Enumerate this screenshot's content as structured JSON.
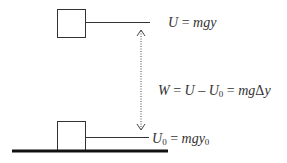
{
  "figure": {
    "width": 287,
    "height": 163,
    "colors": {
      "stroke": "#333333",
      "ground": "#111111",
      "text": "#333333",
      "background": "#ffffff"
    }
  },
  "top_block": {
    "x": 57,
    "y": 9,
    "size": 28,
    "reference_line": {
      "x1": 85,
      "x2": 150,
      "y": 22
    },
    "label": {
      "symbol": "U",
      "equals": " = ",
      "expr": "mgy"
    }
  },
  "bottom_block": {
    "x": 57,
    "y": 121,
    "size": 29,
    "reference_line": {
      "x1": 85,
      "x2": 149,
      "y": 137
    },
    "label": {
      "symbol": "U",
      "sub": "0",
      "equals": " = ",
      "expr": "mgy",
      "expr_sub": "0"
    }
  },
  "ground": {
    "x1": 12,
    "x2": 168,
    "y": 151,
    "thickness": 3
  },
  "displacement_arrow": {
    "x": 141,
    "y1": 30,
    "y2": 130,
    "style": "dotted",
    "heads": "both"
  },
  "work_equation": {
    "W": "W",
    "eq1": " = ",
    "U": "U",
    "minus": " – ",
    "U0": "U",
    "U0_sub": "0",
    "eq2": " = ",
    "mg": "mg",
    "delta": "Δ",
    "y": "y"
  }
}
